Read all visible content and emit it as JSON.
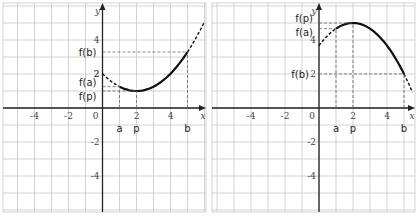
{
  "chart_data": [
    {
      "type": "line",
      "title": "",
      "xlabel": "x",
      "ylabel": "y",
      "xlim": [
        -6,
        6
      ],
      "ylim": [
        -6,
        6
      ],
      "grid": true,
      "x_ticks": [
        -4,
        -2,
        0,
        2,
        4
      ],
      "y_ticks": [
        4,
        2,
        -2,
        -4
      ],
      "curve": "upward parabola with minimum at x=2",
      "series": [
        {
          "name": "f(x) solid on [a,b]",
          "x": [
            1,
            2,
            3,
            4,
            5
          ],
          "y": [
            1.2,
            1.0,
            1.4,
            2.2,
            3.3
          ],
          "style": "solid"
        },
        {
          "name": "f(x) dashed outside",
          "x": [
            0,
            1,
            5,
            6
          ],
          "y": [
            1.8,
            1.2,
            3.3,
            5.5
          ],
          "style": "dashed"
        }
      ],
      "annotations": {
        "a": 1,
        "p": 2,
        "b": 5,
        "f(a)": 1.2,
        "f(p)": 1.0,
        "f(b)": 3.0
      },
      "labels": {
        "x_axis": "x",
        "y_axis": "y",
        "a": "a",
        "p": "p",
        "b": "b",
        "fa": "f(a)",
        "fp": "f(p)",
        "fb": "f(b)",
        "origin": "0"
      }
    },
    {
      "type": "line",
      "title": "",
      "xlabel": "x",
      "ylabel": "y",
      "xlim": [
        -6,
        6
      ],
      "ylim": [
        -6,
        6
      ],
      "grid": true,
      "x_ticks": [
        -4,
        -2,
        0,
        2,
        4
      ],
      "y_ticks": [
        4,
        2,
        -2,
        -4
      ],
      "curve": "downward parabola with maximum at x=2",
      "series": [
        {
          "name": "f(x) solid on [a,b]",
          "x": [
            1,
            2,
            3,
            4,
            5
          ],
          "y": [
            4.7,
            5.0,
            4.6,
            3.6,
            2.0
          ],
          "style": "solid"
        },
        {
          "name": "f(x) dashed outside",
          "x": [
            0,
            1,
            5,
            5.5
          ],
          "y": [
            3.5,
            4.7,
            2.0,
            0.8
          ],
          "style": "dashed"
        }
      ],
      "annotations": {
        "a": 1,
        "p": 2,
        "b": 5,
        "f(a)": 4.7,
        "f(p)": 5.0,
        "f(b)": 2.0
      },
      "labels": {
        "x_axis": "x",
        "y_axis": "y",
        "a": "a",
        "p": "p",
        "b": "b",
        "fa": "f(a)",
        "fp": "f(p)",
        "fb": "f(b)",
        "origin": "0"
      }
    }
  ]
}
